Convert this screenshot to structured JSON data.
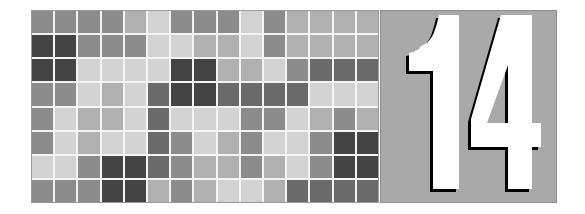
{
  "badge": {
    "number": "14",
    "panel_color": "#a9a9a9",
    "digit_color": "#ffffff",
    "shadow_color": "#000000"
  },
  "mosaic": {
    "columns": 15,
    "rows": 8,
    "palette": {
      "1": "#d2d2d2",
      "2": "#b0b0b0",
      "3": "#8c8c8c",
      "4": "#6a6a6a",
      "5": "#444444"
    },
    "grid": [
      [
        3,
        3,
        3,
        3,
        2,
        1,
        3,
        3,
        3,
        1,
        3,
        2,
        2,
        2,
        2
      ],
      [
        5,
        5,
        3,
        3,
        3,
        1,
        1,
        2,
        2,
        1,
        3,
        2,
        2,
        2,
        2
      ],
      [
        5,
        5,
        1,
        1,
        1,
        1,
        5,
        5,
        2,
        2,
        1,
        3,
        4,
        4,
        4
      ],
      [
        3,
        3,
        1,
        2,
        1,
        4,
        5,
        5,
        4,
        4,
        4,
        4,
        1,
        1,
        1
      ],
      [
        3,
        1,
        2,
        2,
        1,
        4,
        1,
        1,
        1,
        3,
        3,
        1,
        2,
        3,
        2
      ],
      [
        3,
        1,
        2,
        1,
        1,
        4,
        3,
        1,
        2,
        3,
        1,
        1,
        3,
        5,
        5
      ],
      [
        1,
        1,
        3,
        5,
        5,
        4,
        3,
        2,
        2,
        3,
        2,
        1,
        3,
        5,
        5
      ],
      [
        3,
        3,
        3,
        5,
        5,
        2,
        3,
        2,
        1,
        1,
        2,
        4,
        4,
        4,
        4
      ]
    ]
  }
}
